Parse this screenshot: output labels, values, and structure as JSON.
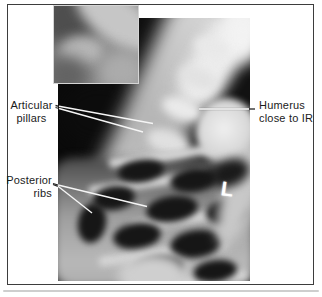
{
  "figure": {
    "labels": {
      "articular_pillars": {
        "line1": "Articular",
        "line2": "pillars"
      },
      "posterior_ribs": {
        "line1": "Posterior",
        "line2": "ribs"
      },
      "humerus": {
        "line1": "Humerus",
        "line2": "close to IR"
      }
    },
    "xray": {
      "side_marker": "L"
    },
    "colors": {
      "page_background": "#ffffff",
      "frame_border": "#3d3d3d",
      "xray_background": "#121212",
      "label_text": "#1b1b1b",
      "leader_line_light": "#f5f5f5",
      "leader_line_dark": "#222222",
      "marker_color": "#ffffff"
    }
  }
}
